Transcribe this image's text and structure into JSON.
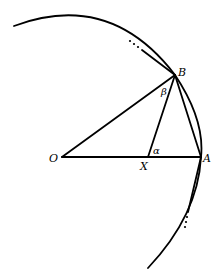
{
  "diagram": {
    "type": "geometry",
    "colors": {
      "stroke": "#000000",
      "background": "#ffffff"
    },
    "points": {
      "O": {
        "label": "O",
        "x": 62,
        "y": 157
      },
      "A": {
        "label": "A",
        "x": 201,
        "y": 157
      },
      "B": {
        "label": "B",
        "x": 175,
        "y": 75
      },
      "X": {
        "label": "X",
        "x": 148,
        "y": 157
      }
    },
    "angles": {
      "alpha": {
        "label": "α",
        "at": "X",
        "between": [
          "XA",
          "XB"
        ]
      },
      "beta": {
        "label": "β",
        "at": "B",
        "between": [
          "BO",
          "BX"
        ]
      }
    },
    "segments": [
      {
        "name": "OA",
        "from": "O",
        "to": "A"
      },
      {
        "name": "OB",
        "from": "O",
        "to": "B"
      },
      {
        "name": "BX",
        "from": "B",
        "to": "X"
      },
      {
        "name": "BA",
        "from": "B",
        "to": "A"
      }
    ],
    "ellipses": {
      "top": "...",
      "bottom": "..."
    }
  }
}
